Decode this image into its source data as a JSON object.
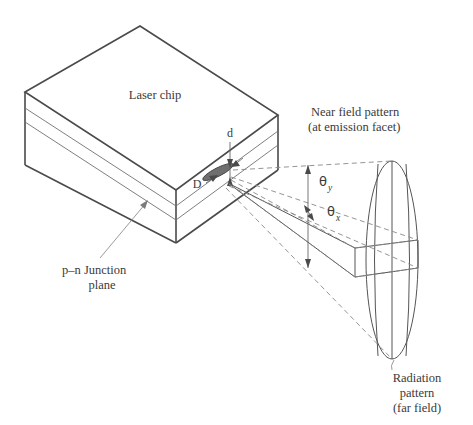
{
  "figure": {
    "title_hidden": "",
    "background_color": "#ffffff",
    "stroke_color": "#555555",
    "dash_color": "#888888",
    "spot_fill": "#6f6f6f"
  },
  "labels": {
    "laser_chip": "Laser chip",
    "near_field_line1": "Near field pattern",
    "near_field_line2": "(at emission facet)",
    "junction_line1_prefix": "p",
    "junction_line1_dash": "–",
    "junction_line1_suffix": "n",
    "junction_line1_rest": " Junction",
    "junction_line2": "plane",
    "radiation_line1": "Radiation",
    "radiation_line2": "pattern",
    "radiation_line3": "(far field)",
    "dim_d": "d",
    "dim_D": "D",
    "theta_symbol": "θ",
    "theta_y_sub": "y",
    "theta_x_sub": "x"
  },
  "elements": {
    "chip": "laser-chip-body",
    "near_field_spot": "near-field-elliptical-spot",
    "far_field_ellipse": "far-field-radiation-ellipse",
    "beam_slab": "beam-parallelogram"
  }
}
